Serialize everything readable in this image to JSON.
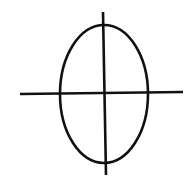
{
  "diagram": {
    "type": "ellipse-with-crosshair",
    "background": "#ffffff",
    "stroke_color": "#111111",
    "stroke_width": 2.6,
    "ellipse": {
      "cx": 104,
      "cy": 94,
      "rx": 44,
      "ry": 69
    },
    "horizontal_line": {
      "x1": 20,
      "y1": 94,
      "x2": 183,
      "y2": 92
    },
    "vertical_line": {
      "x1": 103,
      "y1": 12,
      "x2": 106,
      "y2": 175
    }
  }
}
